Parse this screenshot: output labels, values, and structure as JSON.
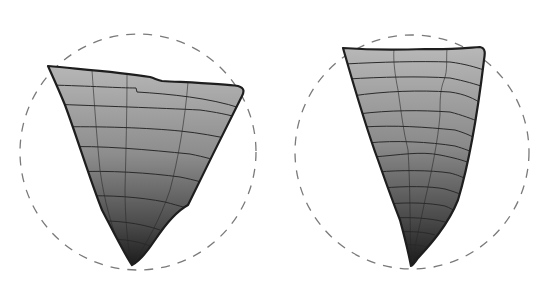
{
  "diagram": {
    "colors": {
      "background": "#ffffff",
      "circle_dash": "#7a7a7a",
      "outline": "#1e1e1e",
      "gradient_top": "#b4b4b4",
      "gradient_bottom": "#1c1c1c",
      "grid_line": "#2a2a2a"
    },
    "figures": [
      {
        "id": "left-wedge",
        "circle": {
          "cx": 138,
          "cy": 152,
          "r": 118
        },
        "horizontal_contours": 8,
        "vertical_contours": 3
      },
      {
        "id": "right-wedge",
        "circle": {
          "cx": 412,
          "cy": 152,
          "r": 117
        },
        "horizontal_contours": 13,
        "vertical_contours": 2
      }
    ]
  }
}
